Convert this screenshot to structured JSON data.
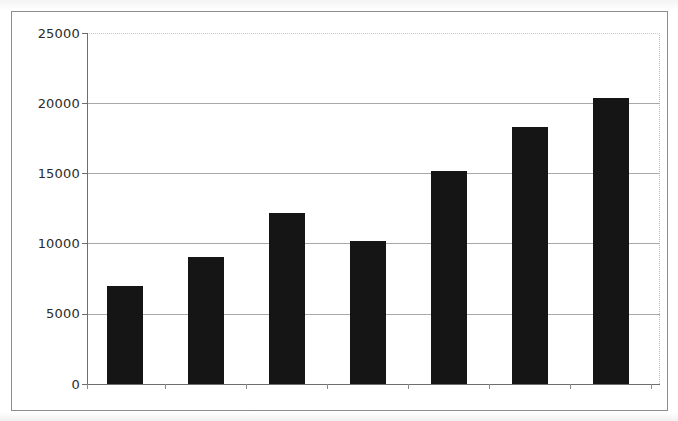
{
  "chart_data": {
    "type": "bar",
    "title": "",
    "subtitle": "",
    "xlabel": "",
    "ylabel": "",
    "categories": [
      "2001",
      "2002",
      "2003",
      "2004",
      "2005",
      "2006",
      "2007"
    ],
    "values": [
      7000,
      9050,
      12150,
      10150,
      15200,
      18300,
      20400
    ],
    "series": [
      {
        "name": "",
        "values": [
          7000,
          9050,
          12150,
          10150,
          15200,
          18300,
          20400
        ]
      }
    ],
    "ylim": [
      0,
      25000
    ],
    "ytick_labels": [
      "0",
      "5000",
      "10000",
      "15000",
      "20000",
      "25000"
    ],
    "ytick_values": [
      0,
      5000,
      10000,
      15000,
      20000,
      25000
    ],
    "grid": "horizontal",
    "legend": "none",
    "bar_color": "#151515",
    "axis_color": "#6e6e6e",
    "gridline_color": "#a8a8a8",
    "plot_background": "#ffffff",
    "annotations": []
  }
}
